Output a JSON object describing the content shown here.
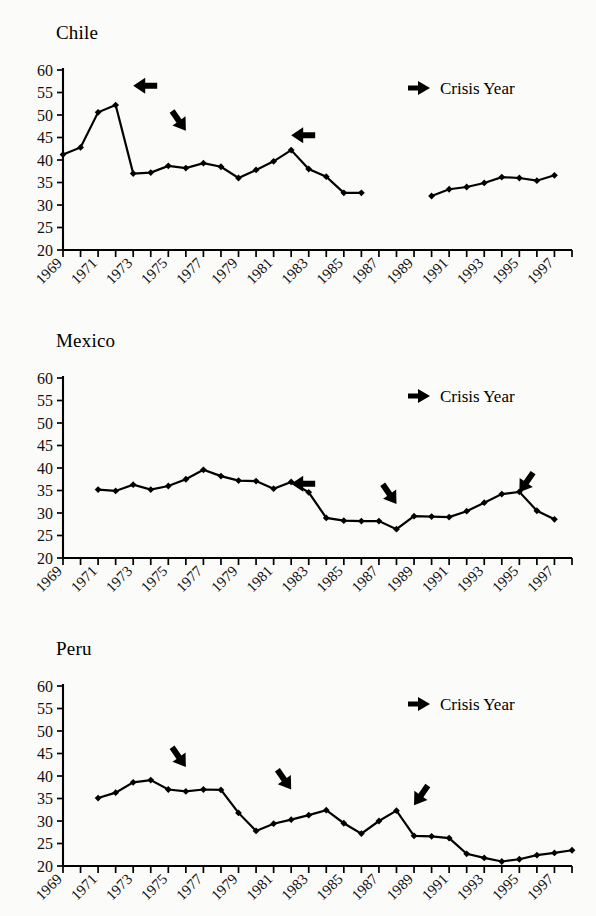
{
  "figure": {
    "legend_label": "Crisis Year",
    "legend_icon": "right-arrow-icon",
    "y_ticks": [
      20,
      25,
      30,
      35,
      40,
      45,
      50,
      55,
      60
    ],
    "x_tick_labels": [
      "1969",
      "1971",
      "1973",
      "1975",
      "1977",
      "1979",
      "1981",
      "1983",
      "1985",
      "1987",
      "1989",
      "1991",
      "1993",
      "1995",
      "1997"
    ],
    "x_first_year": 1969,
    "x_last_year": 1998
  },
  "panels": [
    {
      "id": "chile",
      "title": "Chile"
    },
    {
      "id": "mexico",
      "title": "Mexico"
    },
    {
      "id": "peru",
      "title": "Peru"
    }
  ],
  "chart_data": [
    {
      "type": "line",
      "title": "Chile",
      "xlabel": "",
      "ylabel": "",
      "ylim": [
        20,
        60
      ],
      "xlim": [
        1969,
        1998
      ],
      "grid": false,
      "legend": "Crisis Year",
      "legend_position": "top-right",
      "segments": [
        {
          "x": [
            1969,
            1970,
            1971,
            1972,
            1973,
            1974,
            1975,
            1976,
            1977,
            1978,
            1979,
            1980,
            1981,
            1982,
            1983,
            1984,
            1985,
            1986
          ],
          "y": [
            41.2,
            42.8,
            50.6,
            52.2,
            37.0,
            37.2,
            38.7,
            38.2,
            39.3,
            38.5,
            36.0,
            37.8,
            39.7,
            42.2,
            38.0,
            36.3,
            32.7,
            32.7
          ]
        },
        {
          "x": [
            1990,
            1991,
            1992,
            1993,
            1994,
            1995,
            1996,
            1997
          ],
          "y": [
            32.0,
            33.5,
            34.0,
            34.9,
            36.2,
            36.0,
            35.4,
            36.6
          ]
        }
      ],
      "crisis_arrows": [
        {
          "year": 1973,
          "value": 56.5,
          "direction": "left"
        },
        {
          "year": 1976,
          "value": 46.5,
          "direction": "down-right"
        },
        {
          "year": 1982,
          "value": 45.5,
          "direction": "left"
        }
      ]
    },
    {
      "type": "line",
      "title": "Mexico",
      "xlabel": "",
      "ylabel": "",
      "ylim": [
        20,
        60
      ],
      "xlim": [
        1969,
        1998
      ],
      "grid": false,
      "legend": "Crisis Year",
      "legend_position": "top-right",
      "segments": [
        {
          "x": [
            1971,
            1972,
            1973,
            1974,
            1975,
            1976,
            1977,
            1978,
            1979,
            1980,
            1981,
            1982,
            1983,
            1984,
            1985,
            1986,
            1987,
            1988,
            1989,
            1990,
            1991,
            1992,
            1993,
            1994,
            1995,
            1996,
            1997
          ],
          "y": [
            35.2,
            34.9,
            36.3,
            35.2,
            36.0,
            37.5,
            39.6,
            38.2,
            37.2,
            37.1,
            35.4,
            36.9,
            34.6,
            28.9,
            28.3,
            28.2,
            28.2,
            26.4,
            29.3,
            29.2,
            29.1,
            30.4,
            32.3,
            34.2,
            34.7,
            30.5,
            28.6
          ]
        }
      ],
      "crisis_arrows": [
        {
          "year": 1982,
          "value": 36.5,
          "direction": "left"
        },
        {
          "year": 1988,
          "value": 32.0,
          "direction": "down-right"
        },
        {
          "year": 1995,
          "value": 34.6,
          "direction": "down-left"
        }
      ]
    },
    {
      "type": "line",
      "title": "Peru",
      "xlabel": "",
      "ylabel": "",
      "ylim": [
        20,
        60
      ],
      "xlim": [
        1969,
        1998
      ],
      "grid": false,
      "legend": "Crisis Year",
      "legend_position": "top-right",
      "segments": [
        {
          "x": [
            1971,
            1972,
            1973,
            1974,
            1975,
            1976,
            1977,
            1978,
            1979,
            1980,
            1981,
            1982,
            1983,
            1984,
            1985,
            1986,
            1987,
            1988,
            1989,
            1990,
            1991,
            1992,
            1993,
            1994,
            1995,
            1996,
            1997,
            1998
          ],
          "y": [
            35.1,
            36.3,
            38.6,
            39.1,
            37.0,
            36.6,
            37.0,
            36.9,
            31.8,
            27.8,
            29.4,
            30.3,
            31.3,
            32.4,
            29.5,
            27.2,
            30.0,
            32.3,
            26.7,
            26.6,
            26.2,
            22.7,
            21.8,
            21.0,
            21.5,
            22.4,
            22.9,
            23.5
          ]
        }
      ],
      "crisis_arrows": [
        {
          "year": 1976,
          "value": 42.0,
          "direction": "down-right"
        },
        {
          "year": 1982,
          "value": 37.0,
          "direction": "down-right"
        },
        {
          "year": 1989,
          "value": 33.5,
          "direction": "down-left"
        }
      ]
    }
  ]
}
